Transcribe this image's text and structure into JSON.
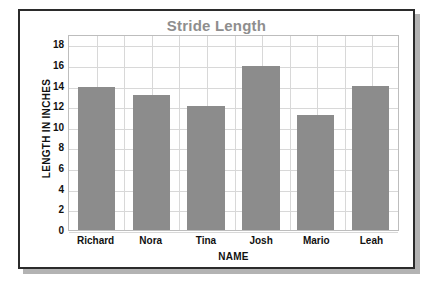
{
  "chart_data": {
    "type": "bar",
    "title": "Stride Length",
    "xlabel": "NAME",
    "ylabel": "LENGTH IN INCHES",
    "categories": [
      "Richard",
      "Nora",
      "Tina",
      "Josh",
      "Mario",
      "Leah"
    ],
    "values": [
      14.0,
      13.2,
      12.1,
      16.1,
      11.3,
      14.1
    ],
    "ylim": [
      0,
      19
    ],
    "yticks": [
      0,
      2,
      4,
      6,
      8,
      10,
      12,
      14,
      16,
      18
    ],
    "ytick_labels": [
      "0",
      "2",
      "4",
      "6",
      "8",
      "10",
      "12",
      "14",
      "16",
      "18"
    ],
    "grid": true,
    "minor_vertical_divisions_per_category": 2,
    "legend": null,
    "legend_position": "none",
    "series": [
      {
        "name": "Stride Length",
        "values": [
          14.0,
          13.2,
          12.1,
          16.1,
          11.3,
          14.1
        ]
      }
    ],
    "colors": {
      "bar": "#8c8c8c",
      "title": "#8e8e8e",
      "axis_text": "#111111",
      "gridline": "#d8d8d8",
      "plot_border": "#bdbdbd",
      "frame_border": "#2b2b2b",
      "frame_shadow": "#b3b3b3",
      "background": "#ffffff"
    }
  }
}
